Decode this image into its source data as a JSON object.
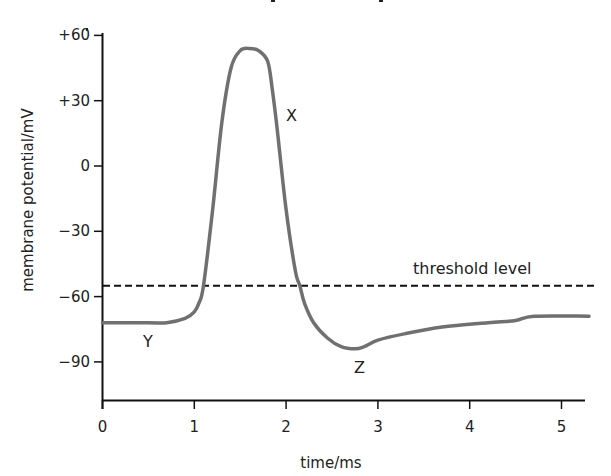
{
  "chart_data": {
    "type": "line",
    "title": "",
    "xlabel": "time/ms",
    "ylabel": "membrane potential/mV",
    "xlim": [
      0,
      5.3
    ],
    "ylim": [
      -107,
      60
    ],
    "grid": false,
    "legend": "none",
    "x_ticks": [
      "0",
      "1",
      "2",
      "3",
      "4",
      "5"
    ],
    "y_ticks": [
      "+60",
      "+30",
      "0",
      "−30",
      "−60",
      "−90"
    ],
    "y_tick_values": [
      60,
      30,
      0,
      -30,
      -60,
      -90
    ],
    "x_tick_values": [
      0,
      1,
      2,
      3,
      4,
      5
    ],
    "series": [
      {
        "name": "action potential",
        "color": "#707070",
        "x": [
          0,
          0.5,
          0.7,
          0.9,
          1.0,
          1.05,
          1.1,
          1.2,
          1.3,
          1.4,
          1.5,
          1.6,
          1.7,
          1.8,
          1.85,
          1.9,
          2.0,
          2.1,
          2.15,
          2.2,
          2.3,
          2.45,
          2.6,
          2.75,
          2.85,
          3.0,
          3.3,
          3.7,
          4.2,
          4.5,
          4.7,
          5.3
        ],
        "values": [
          -72,
          -72,
          -72,
          -70,
          -67,
          -63,
          -55,
          -20,
          20,
          45,
          53,
          54,
          53,
          48,
          35,
          18,
          -20,
          -48,
          -55,
          -63,
          -72,
          -79,
          -83,
          -84,
          -83,
          -80,
          -77,
          -74,
          -72,
          -71,
          -69,
          -69
        ]
      }
    ],
    "reference_lines": [
      {
        "name": "threshold level",
        "y": -55,
        "style": "dashed",
        "color": "#111111"
      }
    ],
    "annotations": [
      {
        "text": "X",
        "x": 2.0,
        "y": 39,
        "note": "repolarisation phase"
      },
      {
        "text": "Y",
        "x": 0.5,
        "y": -84,
        "note": "resting potential"
      },
      {
        "text": "Z",
        "x": 2.8,
        "y": -95,
        "note": "hyperpolarisation"
      },
      {
        "text": "threshold level",
        "x": 4.2,
        "y": -51
      }
    ]
  },
  "labels": {
    "x_axis_title": "time/ms",
    "y_axis_title": "membrane potential/mV",
    "threshold": "threshold level",
    "point_x": "X",
    "point_y": "Y",
    "point_z": "Z",
    "ticks_y": [
      "+60",
      "+30",
      "0",
      "−30",
      "−60",
      "−90"
    ],
    "ticks_x": [
      "0",
      "1",
      "2",
      "3",
      "4",
      "5"
    ]
  }
}
